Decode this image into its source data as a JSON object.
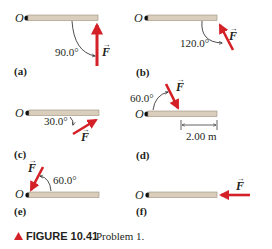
{
  "figure": {
    "caption_label": "FIGURE 10.41",
    "caption_text": "Problem 1.",
    "caption_marker": "triangle-up",
    "colors": {
      "force": "#d42027",
      "rod": "#d9cdbb",
      "rod_edge": "#9b8f7f",
      "text": "#231f20"
    },
    "force_symbol": "F",
    "pivot_symbol": "O"
  },
  "panels": [
    {
      "id": "a",
      "label": "(a)",
      "angle": "90.0°"
    },
    {
      "id": "b",
      "label": "(b)",
      "angle": "120.0°"
    },
    {
      "id": "c",
      "label": "(c)",
      "angle": "30.0°"
    },
    {
      "id": "d",
      "label": "(d)",
      "angle": "60.0°",
      "dimension": "2.00 m"
    },
    {
      "id": "e",
      "label": "(e)",
      "angle": "60.0°"
    },
    {
      "id": "f",
      "label": "(f)",
      "angle": ""
    }
  ]
}
